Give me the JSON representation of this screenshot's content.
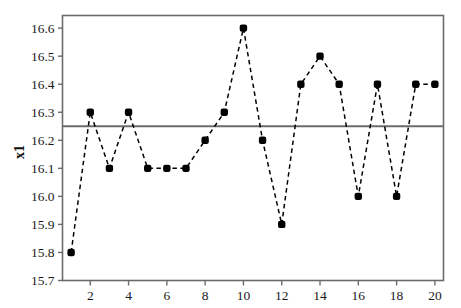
{
  "chart_data": {
    "type": "line",
    "title": "",
    "subtitle": "",
    "xlabel": "",
    "ylabel": "x1",
    "x": [
      1,
      2,
      3,
      4,
      5,
      6,
      7,
      8,
      9,
      10,
      11,
      12,
      13,
      14,
      15,
      16,
      17,
      18,
      19,
      20
    ],
    "values": [
      15.8,
      16.3,
      16.1,
      16.3,
      16.1,
      16.1,
      16.1,
      16.2,
      16.3,
      16.6,
      16.2,
      15.9,
      16.4,
      16.5,
      16.4,
      16.0,
      16.4,
      16.0,
      16.4,
      16.4
    ],
    "series": [
      {
        "name": "x1",
        "values": [
          15.8,
          16.3,
          16.1,
          16.3,
          16.1,
          16.1,
          16.1,
          16.2,
          16.3,
          16.6,
          16.2,
          15.9,
          16.4,
          16.5,
          16.4,
          16.0,
          16.4,
          16.0,
          16.4,
          16.4
        ],
        "line_style": "dashed",
        "marker": "filled-square",
        "color": "#000000"
      }
    ],
    "xlim": [
      0.55,
      20.45
    ],
    "ylim": [
      15.7,
      16.645
    ],
    "xticks": [
      2,
      4,
      6,
      8,
      10,
      12,
      14,
      16,
      18,
      20
    ],
    "xtick_labels": [
      "2",
      "4",
      "6",
      "8",
      "10",
      "12",
      "14",
      "16",
      "18",
      "20"
    ],
    "yticks": [
      15.7,
      15.8,
      15.9,
      16.0,
      16.1,
      16.2,
      16.3,
      16.4,
      16.5,
      16.6
    ],
    "ytick_labels": [
      "15.7",
      "15.8",
      "15.9",
      "16.0",
      "16.1",
      "16.2",
      "16.3",
      "16.4",
      "16.5",
      "16.6"
    ],
    "grid": false,
    "legend": false,
    "legend_position": "none",
    "reference_lines": [
      {
        "name": "center-line",
        "orientation": "horizontal",
        "value": 16.25,
        "color": "#6b6b6b",
        "style": "solid"
      }
    ],
    "frame_color": "#6b6b6b",
    "background": "#ffffff"
  }
}
